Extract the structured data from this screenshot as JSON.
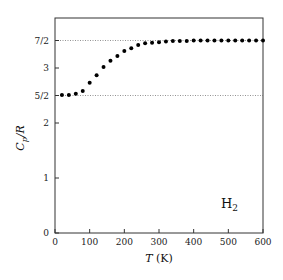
{
  "chart_data": {
    "type": "scatter",
    "title": "",
    "xlabel": "T (K)",
    "ylabel": "Cp/R",
    "xlim": [
      0,
      600
    ],
    "ylim": [
      0,
      3.9
    ],
    "x_ticks": [
      0,
      100,
      200,
      300,
      400,
      500,
      600
    ],
    "y_ticks": [
      {
        "value": 0,
        "label": "0"
      },
      {
        "value": 1,
        "label": "1"
      },
      {
        "value": 2,
        "label": "2"
      },
      {
        "value": 2.5,
        "label": "5/2"
      },
      {
        "value": 3,
        "label": "3"
      },
      {
        "value": 3.5,
        "label": "7/2"
      }
    ],
    "reference_lines": [
      {
        "y": 2.5,
        "style": "dotted"
      },
      {
        "y": 3.5,
        "style": "dotted"
      }
    ],
    "annotation": "H2",
    "grid": false,
    "series": [
      {
        "name": "H2",
        "x": [
          20,
          40,
          60,
          80,
          100,
          120,
          140,
          160,
          180,
          200,
          220,
          240,
          260,
          280,
          300,
          320,
          340,
          360,
          380,
          400,
          420,
          440,
          460,
          480,
          500,
          520,
          540,
          560,
          580,
          600
        ],
        "y": [
          2.51,
          2.51,
          2.53,
          2.58,
          2.73,
          2.87,
          3.02,
          3.13,
          3.22,
          3.31,
          3.36,
          3.42,
          3.45,
          3.46,
          3.47,
          3.48,
          3.49,
          3.49,
          3.49,
          3.5,
          3.5,
          3.5,
          3.5,
          3.5,
          3.5,
          3.5,
          3.5,
          3.5,
          3.5,
          3.5
        ]
      }
    ]
  },
  "labels": {
    "xlabel_italic": "T",
    "xlabel_unit": " (K)",
    "ylabel_main": "C",
    "ylabel_sub": "p",
    "ylabel_rest": "/R",
    "annot_main": "H",
    "annot_sub": "2"
  }
}
